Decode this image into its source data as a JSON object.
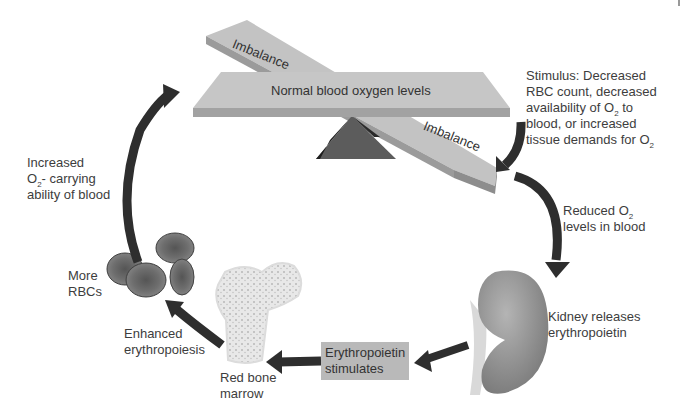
{
  "diagram": {
    "type": "feedback-loop",
    "topic": "Erythropoietin regulation of blood oxygen levels",
    "seesaw": {
      "center_label": "Normal blood oxygen levels",
      "left_plank_label": "Imbalance",
      "right_plank_label": "Imbalance"
    },
    "steps": {
      "stimulus": {
        "line1": "Stimulus: Decreased",
        "line2": "RBC count, decreased",
        "line3_pre": "availability of O",
        "line3_sub": "2",
        "line3_post": " to",
        "line4": "blood, or  increased",
        "line5_pre": "tissue demands for O",
        "line5_sub": "2"
      },
      "reduced_o2": {
        "line1_pre": "Reduced O",
        "line1_sub": "2",
        "line2": "levels in blood"
      },
      "kidney": {
        "line1": "Kidney releases",
        "line2": "erythropoietin"
      },
      "epo_box": {
        "line1": "Erythropoietin",
        "line2": "stimulates"
      },
      "marrow": {
        "line1": "Red bone",
        "line2": "marrow"
      },
      "erythropoiesis": {
        "line1": "Enhanced",
        "line2": "erythropoiesis"
      },
      "rbcs": {
        "line1": "More",
        "line2": "RBCs"
      },
      "increased_capacity": {
        "line1": "Increased",
        "line2_pre": "O",
        "line2_sub": "2",
        "line2_post": "- carrying",
        "line3": "ability of blood"
      }
    },
    "colors": {
      "arrow": "#2e2e2e",
      "plank": "#bdbdbd",
      "plank_edge": "#9a9a9a",
      "fulcrum": "#555555",
      "kidney": "#8f8f8f",
      "rbc": "#6a6a6a",
      "bone": "#ececec",
      "epo_box": "#b9b9b9"
    }
  }
}
